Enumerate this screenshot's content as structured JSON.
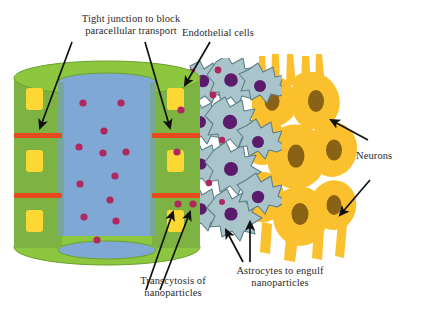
{
  "figure": {
    "title_cropped": "Figure: nanoparticle transport across the blood-brain barrier",
    "domain": "biology-diagram"
  },
  "labels": {
    "tight_junction": "Tight junction to block\nparacellular transport",
    "endothelial_cells": "Endothelial cells",
    "neurons": "Neurons",
    "transcytosis": "Transcytosis of\nnanoparticles",
    "astrocytes": "Astrocytes to engulf\nnanoparticles"
  },
  "colors": {
    "endothelium_green": "#7cb342",
    "endothelium_green_light": "#8cc63f",
    "cylinder_top_green": "#8dc63f",
    "lumen_blue": "#7fa8d4",
    "lumen_blue_dark": "#6f9acb",
    "nucleus_yellow": "#fdd835",
    "nucleus_yellow_pale": "#ffe680",
    "tight_junction_red": "#e8491d",
    "nanoparticle_magenta": "#a81f5e",
    "nanoparticle_pink": "#c0306e",
    "astrocyte_body": "#a9c4ca",
    "astrocyte_outline": "#5d7f88",
    "astrocyte_nucleus": "#5b1a6b",
    "neuron_yellow": "#fbc02d",
    "neuron_yellow_light": "#fdd040",
    "neuron_nucleus": "#8a6215",
    "arrow_black": "#111111",
    "text": "#2b2b2b",
    "background": "#ffffff"
  },
  "structures": {
    "blood_vessel": {
      "name": "blood-vessel-cylinder",
      "lumen_label": "vessel lumen",
      "endothelial_cell_rows": 3,
      "tight_junction_count": 4,
      "nuclei_per_side": 3,
      "nanoparticles_in_lumen": 13,
      "nanoparticles_in_endothelium": 6
    },
    "astrocyte_layer": {
      "name": "astrocyte-layer",
      "cell_count": 12,
      "nuclei_count": 10,
      "engulfed_nanoparticles": 9
    },
    "neuron_layer": {
      "name": "neuron-layer",
      "cell_count": 9,
      "nuclei_count": 9
    }
  },
  "arrows": [
    {
      "name": "arrow-tight-junction-left",
      "points_to": "left tight junction"
    },
    {
      "name": "arrow-tight-junction-right",
      "points_to": "right tight junction"
    },
    {
      "name": "arrow-endothelial-cells",
      "points_to": "endothelial cell"
    },
    {
      "name": "arrow-transcytosis-1",
      "points_to": "nanoparticle in endothelium"
    },
    {
      "name": "arrow-transcytosis-2",
      "points_to": "nanoparticle crossing membrane"
    },
    {
      "name": "arrow-astrocytes-1",
      "points_to": "astrocyte process"
    },
    {
      "name": "arrow-astrocytes-2",
      "points_to": "astrocyte body"
    },
    {
      "name": "arrow-neurons-upper",
      "points_to": "upper neuron"
    },
    {
      "name": "arrow-neurons-lower",
      "points_to": "lower neuron"
    }
  ]
}
